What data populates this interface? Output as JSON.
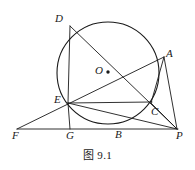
{
  "figure": {
    "caption": "图 9.1",
    "stroke_color": "#1a1a1a",
    "background_color": "#ffffff",
    "labels": {
      "D": "D",
      "A": "A",
      "O": "O",
      "E": "E",
      "C": "C",
      "F": "F",
      "G": "G",
      "B": "B",
      "P": "P"
    }
  },
  "chart_data": {
    "type": "diagram",
    "title": "图 9.1",
    "subtype": "euclidean-geometry-circle",
    "xlim": [
      0,
      195
    ],
    "ylim": [
      0,
      170
    ],
    "grid": false,
    "circle": {
      "name": "circle-O",
      "center_label": "O",
      "cx": 108,
      "cy": 73,
      "r": 51
    },
    "points": [
      {
        "label": "D",
        "x": 70,
        "y": 26,
        "on_circle": true,
        "label_x": 55,
        "label_y": 13
      },
      {
        "label": "A",
        "x": 163,
        "y": 57,
        "on_circle": true,
        "label_x": 166,
        "label_y": 48
      },
      {
        "label": "O",
        "x": 108,
        "y": 73,
        "on_circle": false,
        "label_x": 95,
        "label_y": 65
      },
      {
        "label": "E",
        "x": 68,
        "y": 103,
        "on_circle": true,
        "label_x": 54,
        "label_y": 94
      },
      {
        "label": "C",
        "x": 151,
        "y": 103,
        "on_circle": true,
        "label_x": 151,
        "label_y": 106
      },
      {
        "label": "B",
        "x": 110,
        "y": 124,
        "on_circle": true,
        "label_x": 115,
        "label_y": 129
      },
      {
        "label": "F",
        "x": 17,
        "y": 129,
        "on_circle": false,
        "label_x": 12,
        "label_y": 130
      },
      {
        "label": "G",
        "x": 70,
        "y": 129,
        "on_circle": false,
        "label_x": 66,
        "label_y": 130
      },
      {
        "label": "P",
        "x": 176,
        "y": 129,
        "on_circle": false,
        "label_x": 176,
        "label_y": 130
      }
    ],
    "segments": [
      {
        "name": "segment-F-P",
        "from": "F",
        "to": "P",
        "x1": 17,
        "y1": 129,
        "x2": 178,
        "y2": 129
      },
      {
        "name": "segment-F-A",
        "from": "F",
        "to": "A",
        "x1": 17,
        "y1": 129,
        "x2": 164,
        "y2": 57
      },
      {
        "name": "segment-D-P",
        "from": "D",
        "to": "P",
        "x1": 70,
        "y1": 26,
        "x2": 177,
        "y2": 129
      },
      {
        "name": "segment-D-E",
        "from": "D",
        "to": "E",
        "x1": 70,
        "y1": 26,
        "x2": 68,
        "y2": 103
      },
      {
        "name": "segment-E-G",
        "from": "E",
        "to": "G",
        "x1": 68,
        "y1": 103,
        "x2": 70,
        "y2": 129
      },
      {
        "name": "segment-E-C",
        "from": "E",
        "to": "C",
        "x1": 68,
        "y1": 103,
        "x2": 152,
        "y2": 102
      },
      {
        "name": "segment-E-P",
        "from": "E",
        "to": "P",
        "x1": 68,
        "y1": 103,
        "x2": 177,
        "y2": 129
      },
      {
        "name": "segment-A-P",
        "from": "A",
        "to": "P",
        "x1": 164,
        "y1": 57,
        "x2": 177,
        "y2": 129
      },
      {
        "name": "segment-A-C",
        "from": "A",
        "to": "C",
        "x1": 164,
        "y1": 57,
        "x2": 151,
        "y2": 103
      },
      {
        "name": "segment-C-P",
        "from": "C",
        "to": "P",
        "x1": 151,
        "y1": 103,
        "x2": 177,
        "y2": 129
      }
    ]
  }
}
